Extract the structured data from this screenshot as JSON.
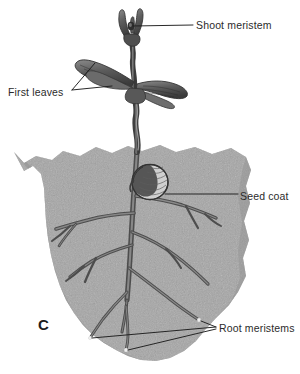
{
  "figure": {
    "panel_letter": "C",
    "colors": {
      "background": "#ffffff",
      "soil": "#a9a9a9",
      "soil_speckle_dark": "#4f4f4f",
      "soil_speckle_light": "#d8d8d8",
      "plant_dark": "#4a4a4a",
      "plant_mid": "#6e6e6e",
      "plant_light": "#9a9a9a",
      "leader_line": "#222222",
      "label_text": "#2b2b2b"
    }
  },
  "labels": [
    {
      "id": "shoot-meristem",
      "text": "Shoot meristem",
      "target": "apical-meristem-at-shoot-tip"
    },
    {
      "id": "first-leaves",
      "text": "First leaves",
      "target": "pair-of-cotyledon-leaves"
    },
    {
      "id": "seed-coat",
      "text": "Seed coat",
      "target": "seed-coat-remnant-below-soil-line"
    },
    {
      "id": "root-meristems",
      "text": "Root meristems",
      "target": "three-root-tips"
    }
  ],
  "structures": [
    {
      "id": "shoot-tip",
      "name": "shoot-tip"
    },
    {
      "id": "first-leaves",
      "name": "first-leaves"
    },
    {
      "id": "hypocotyl",
      "name": "hypocotyl-stem"
    },
    {
      "id": "seed-coat",
      "name": "seed-coat"
    },
    {
      "id": "soil-mass",
      "name": "soil-mass"
    },
    {
      "id": "taproot",
      "name": "taproot"
    },
    {
      "id": "lateral-roots",
      "name": "lateral-roots"
    },
    {
      "id": "root-tips",
      "name": "root-tips"
    }
  ]
}
